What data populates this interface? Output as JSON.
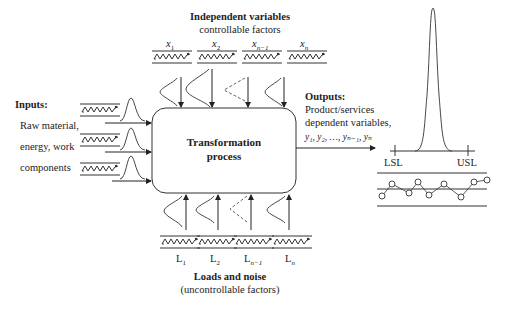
{
  "diagram": {
    "title_top": "Independent variables",
    "subtitle_top": "controllable factors",
    "controllable_factors": [
      {
        "label": "x",
        "sub": "1",
        "dashed": false
      },
      {
        "label": "x",
        "sub": "2",
        "dashed": false
      },
      {
        "label": "x",
        "sub": "n−1",
        "dashed": true
      },
      {
        "label": "x",
        "sub": "n",
        "dashed": false
      }
    ],
    "inputs": {
      "title": "Inputs:",
      "lines": [
        "Raw material,",
        "energy, work",
        "components"
      ],
      "count": 3
    },
    "process": {
      "line1": "Transformation",
      "line2": "process"
    },
    "outputs": {
      "title": "Outputs:",
      "line1": "Product/services",
      "line2": "dependent variables,",
      "vars": "y₁, y₂, …, yₙ₋₁, yₙ"
    },
    "spec_limits": {
      "lower": "LSL",
      "upper": "USL"
    },
    "noise_factors": [
      {
        "label": "L",
        "sub": "1",
        "dashed": false
      },
      {
        "label": "L",
        "sub": "2",
        "dashed": false
      },
      {
        "label": "L",
        "sub": "n−1",
        "dashed": true
      },
      {
        "label": "L",
        "sub": "n",
        "dashed": false
      }
    ],
    "title_bottom": "Loads and noise",
    "subtitle_bottom": "(uncontrollable factors)",
    "control_chart_points": [
      [
        382,
        196
      ],
      [
        392,
        184
      ],
      [
        409,
        193
      ],
      [
        418,
        182
      ],
      [
        429,
        195
      ],
      [
        444,
        184
      ],
      [
        461,
        197
      ],
      [
        474,
        182
      ],
      [
        487,
        180
      ]
    ],
    "colors": {
      "line": "#333333",
      "background": "#ffffff"
    }
  }
}
